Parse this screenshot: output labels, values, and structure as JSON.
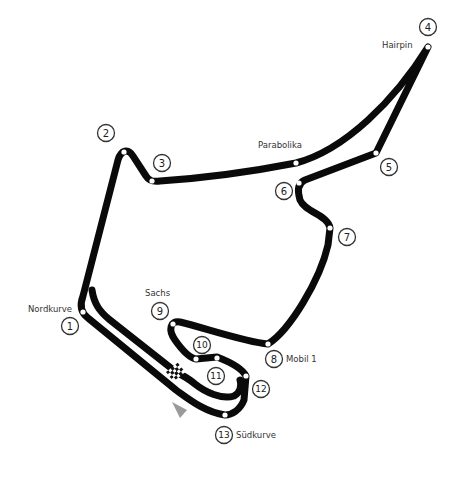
{
  "map": {
    "type": "race-circuit-layout",
    "track_color": "#0a0a0a",
    "background": "#ffffff",
    "corners": [
      {
        "number": "1",
        "name": "Nordkurve"
      },
      {
        "number": "2",
        "name": ""
      },
      {
        "number": "3",
        "name": ""
      },
      {
        "number": "4",
        "name": "Hairpin"
      },
      {
        "number": "5",
        "name": ""
      },
      {
        "number": "6",
        "name": ""
      },
      {
        "number": "7",
        "name": ""
      },
      {
        "number": "8",
        "name": "Mobil 1"
      },
      {
        "number": "9",
        "name": "Sachs"
      },
      {
        "number": "10",
        "name": ""
      },
      {
        "number": "11",
        "name": ""
      },
      {
        "number": "12",
        "name": ""
      },
      {
        "number": "13",
        "name": "Südkurve"
      }
    ],
    "named_sections": [
      {
        "name": "Parabolika"
      }
    ],
    "start_finish": {
      "icon": "checkered-flag-icon",
      "direction": "direction-arrow-icon"
    }
  }
}
